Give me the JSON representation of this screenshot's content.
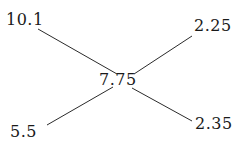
{
  "diagram": {
    "type": "node-link",
    "background_color": "#ffffff",
    "line_color": "#2b2b2b",
    "text_color": "#1a1a1a",
    "center": {
      "id": "center",
      "label": "7.75"
    },
    "leaves": [
      {
        "id": "top-left",
        "label": "10.1"
      },
      {
        "id": "top-right",
        "label": "2.25"
      },
      {
        "id": "bottom-left",
        "label": "5.5"
      },
      {
        "id": "bottom-right",
        "label": "2.35"
      }
    ],
    "edges": [
      {
        "from": "top-left",
        "to": "center",
        "x1": 38,
        "y1": 29,
        "x2": 117,
        "y2": 74
      },
      {
        "from": "center",
        "to": "top-right",
        "x1": 134,
        "y1": 74,
        "x2": 192,
        "y2": 36
      },
      {
        "from": "bottom-left",
        "to": "center",
        "x1": 47,
        "y1": 125,
        "x2": 113,
        "y2": 87
      },
      {
        "from": "center",
        "to": "bottom-right",
        "x1": 132,
        "y1": 88,
        "x2": 192,
        "y2": 121
      }
    ]
  }
}
